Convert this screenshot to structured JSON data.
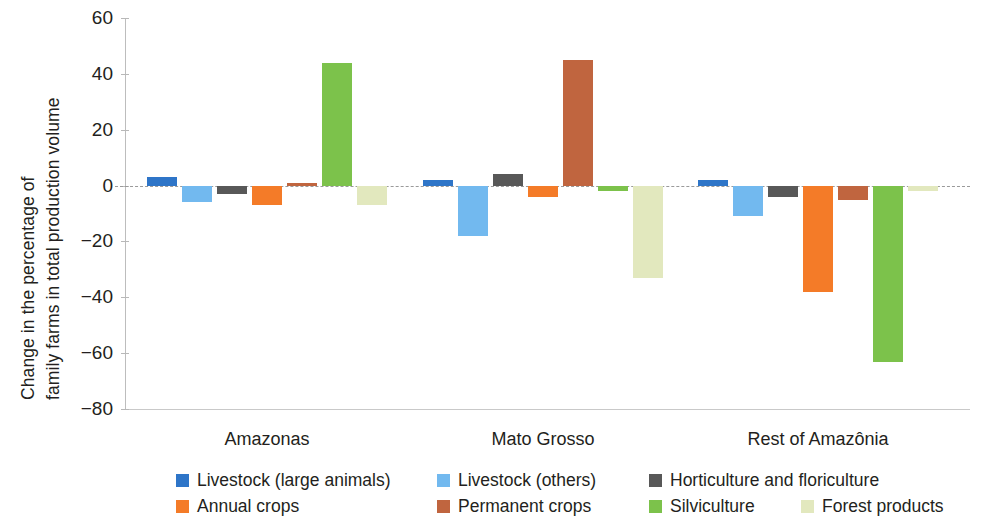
{
  "chart_data": {
    "type": "bar",
    "title": "",
    "subtitle": "",
    "xlabel": "",
    "ylabel": "Change in the percentage of family farms in total production volume",
    "ylabel_lines": [
      "Change in the percentage of",
      "family farms in total production volume"
    ],
    "categories": [
      "Amazonas",
      "Mato Grosso",
      "Rest of Amazônia"
    ],
    "ylim": [
      -80,
      60
    ],
    "yticks": [
      60,
      40,
      20,
      0,
      -20,
      -40,
      -60,
      -80
    ],
    "ytick_labels": [
      "60",
      "40",
      "20",
      "0",
      "−20",
      "−40",
      "−60",
      "−80"
    ],
    "grid": false,
    "zero_line": true,
    "legend_position": "bottom",
    "series": [
      {
        "name": "Livestock (large animals)",
        "color": "#2E75C8",
        "values": [
          3,
          2,
          2
        ]
      },
      {
        "name": "Livestock (others)",
        "color": "#72B9EF",
        "values": [
          -6,
          -18,
          -11
        ]
      },
      {
        "name": "Horticulture and floriculture",
        "color": "#585858",
        "values": [
          -3,
          4,
          -4
        ]
      },
      {
        "name": "Annual crops",
        "color": "#F47B28",
        "values": [
          -7,
          -4,
          -38
        ]
      },
      {
        "name": "Permanent crops",
        "color": "#C0653F",
        "values": [
          1,
          45,
          -5
        ]
      },
      {
        "name": "Silviculture",
        "color": "#7CC24B",
        "values": [
          44,
          -2,
          -63
        ]
      },
      {
        "name": "Forest products",
        "color": "#E2E8BE",
        "values": [
          -7,
          -33,
          -2
        ]
      }
    ]
  },
  "legend": {
    "items": [
      {
        "label": "Livestock (large animals)",
        "color": "#2E75C8"
      },
      {
        "label": "Livestock (others)",
        "color": "#72B9EF"
      },
      {
        "label": "Horticulture and floriculture",
        "color": "#585858"
      },
      {
        "label": "Annual crops",
        "color": "#F47B28"
      },
      {
        "label": "Permanent crops",
        "color": "#C0653F"
      },
      {
        "label": "Silviculture",
        "color": "#7CC24B"
      },
      {
        "label": "Forest products",
        "color": "#E2E8BE"
      }
    ]
  },
  "colors": {
    "axis": "#bdbdbd",
    "zero_line": "#9a9a9a",
    "text": "#231f20",
    "background": "#ffffff"
  }
}
